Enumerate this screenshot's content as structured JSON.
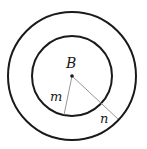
{
  "diagram": {
    "type": "concentric-circles",
    "colors": {
      "circle_stroke": "#1a1a1a",
      "radius_line": "#8a8a8a",
      "center_dot": "#1a1a1a",
      "background": "#ffffff"
    },
    "center": {
      "label": "B",
      "x": 72,
      "y": 76
    },
    "circles": [
      {
        "name": "inner",
        "r": 40
      },
      {
        "name": "outer",
        "r": 64
      }
    ],
    "radii": [
      {
        "label": "m",
        "to_circle": "inner",
        "end_x": 64,
        "end_y": 115,
        "label_x": 52,
        "label_y": 100
      },
      {
        "label": "n",
        "to_circle": "outer",
        "end_x": 118,
        "end_y": 119,
        "label_x": 101,
        "label_y": 122
      }
    ]
  }
}
